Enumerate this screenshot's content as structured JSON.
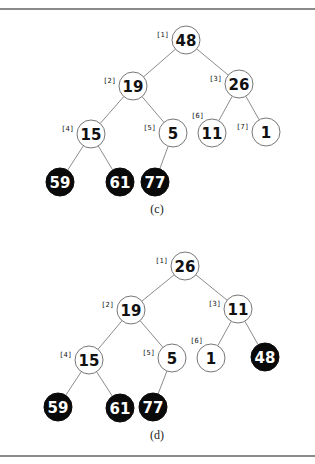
{
  "figures": [
    {
      "caption": "(c)",
      "nodes": [
        {
          "index": "[1]",
          "value": "48",
          "filled": false,
          "x": 186,
          "y": 40
        },
        {
          "index": "[2]",
          "value": "19",
          "filled": false,
          "x": 133,
          "y": 86
        },
        {
          "index": "[3]",
          "value": "26",
          "filled": false,
          "x": 239,
          "y": 84
        },
        {
          "index": "[4]",
          "value": "15",
          "filled": false,
          "x": 91,
          "y": 134
        },
        {
          "index": "[5]",
          "value": "5",
          "filled": false,
          "x": 173,
          "y": 133
        },
        {
          "index": "[6]",
          "value": "11",
          "filled": false,
          "x": 212,
          "y": 133
        },
        {
          "index": "[7]",
          "value": "1",
          "filled": false,
          "x": 266,
          "y": 132
        },
        {
          "index": "[8]",
          "value": "59",
          "filled": true,
          "x": 60,
          "y": 182
        },
        {
          "index": "[9]",
          "value": "61",
          "filled": true,
          "x": 120,
          "y": 182
        },
        {
          "index": "[10]",
          "value": "77",
          "filled": true,
          "x": 155,
          "y": 182
        }
      ],
      "edges": [
        [
          0,
          1
        ],
        [
          0,
          2
        ],
        [
          1,
          3
        ],
        [
          1,
          4
        ],
        [
          2,
          5
        ],
        [
          2,
          6
        ],
        [
          3,
          7
        ],
        [
          3,
          8
        ],
        [
          4,
          9
        ]
      ]
    },
    {
      "caption": "(d)",
      "nodes": [
        {
          "index": "[1]",
          "value": "26",
          "filled": false,
          "x": 185,
          "y": 266
        },
        {
          "index": "[2]",
          "value": "19",
          "filled": false,
          "x": 131,
          "y": 310
        },
        {
          "index": "[3]",
          "value": "11",
          "filled": false,
          "x": 238,
          "y": 309
        },
        {
          "index": "[4]",
          "value": "15",
          "filled": false,
          "x": 89,
          "y": 360
        },
        {
          "index": "[5]",
          "value": "5",
          "filled": false,
          "x": 172,
          "y": 358
        },
        {
          "index": "[6]",
          "value": "1",
          "filled": false,
          "x": 211,
          "y": 358
        },
        {
          "index": "[7]",
          "value": "48",
          "filled": true,
          "x": 265,
          "y": 357
        },
        {
          "index": "[8]",
          "value": "59",
          "filled": true,
          "x": 58,
          "y": 407
        },
        {
          "index": "[9]",
          "value": "61",
          "filled": true,
          "x": 120,
          "y": 408
        },
        {
          "index": "[10]",
          "value": "77",
          "filled": true,
          "x": 153,
          "y": 407
        }
      ],
      "edges": [
        [
          0,
          1
        ],
        [
          0,
          2
        ],
        [
          1,
          3
        ],
        [
          1,
          4
        ],
        [
          2,
          5
        ],
        [
          2,
          6
        ],
        [
          3,
          7
        ],
        [
          3,
          8
        ],
        [
          4,
          9
        ]
      ]
    }
  ],
  "style": {
    "node_radius": 14,
    "filled_color": "#0a0a0a",
    "empty_color": "#ffffff",
    "edge_color": "#8c8c8c"
  }
}
